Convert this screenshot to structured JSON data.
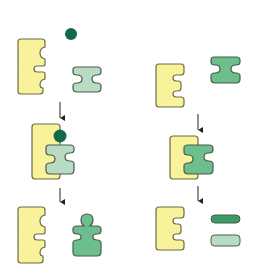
{
  "diagram": {
    "title": "Enzyme-substrate interaction: with cofactor (left) vs without (right)",
    "colors": {
      "enzyme_fill": "#f8f29a",
      "enzyme_stroke": "#6f6b45",
      "substrate_light_fill": "#b8dcc3",
      "substrate_mid_fill": "#6cbf8c",
      "cofactor_fill": "#126a48",
      "product_dark_fill": "#3e9a65",
      "outline": "#4a5a4e",
      "arrow": "#222222",
      "background": "#ffffff"
    },
    "columns": [
      {
        "name": "left-pathway",
        "stages": [
          {
            "label": "enzyme + cofactor + substrate (separate)"
          },
          {
            "label": "enzyme-cofactor-substrate complex"
          },
          {
            "label": "enzyme + product (peg shape)"
          }
        ]
      },
      {
        "name": "right-pathway",
        "stages": [
          {
            "label": "enzyme + substrate (separate)"
          },
          {
            "label": "enzyme-substrate complex"
          },
          {
            "label": "enzyme + two products (bars)"
          }
        ]
      }
    ]
  }
}
